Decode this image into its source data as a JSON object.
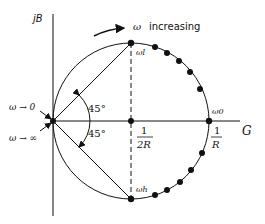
{
  "diagram": {
    "colors": {
      "ink": "#111111",
      "background": "#ffffff"
    },
    "axes": {
      "vertical_label": "jB",
      "horizontal_label": "G"
    },
    "labels": {
      "omega_increasing_symbol": "ω",
      "omega_increasing_text": "increasing",
      "omega_to_zero": "ω → 0",
      "omega_to_infinity": "ω → ∞",
      "angle_upper": "45°",
      "angle_lower": "45°",
      "omega_l": "ωl",
      "omega_h": "ωh",
      "omega_0": "ω0",
      "half_conductance_num": "1",
      "half_conductance_den": "2R",
      "conductance_num": "1",
      "conductance_den": "R"
    },
    "markers": {
      "upper_arc_dots": 6,
      "lower_arc_dots": 6
    }
  }
}
